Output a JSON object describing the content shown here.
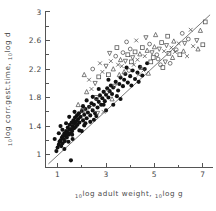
{
  "figure": {
    "background": "#ffffff",
    "ink": "#333333"
  },
  "chart_data": {
    "type": "scatter",
    "title": "",
    "subtitle": "",
    "xlabel": "10log adult weight, 10log g",
    "xlabel_parts": {
      "sub1": "10",
      "main1": "log adult weight,",
      "sub2": "10",
      "main2": "log g"
    },
    "ylabel": "10log corr.gest.time, 10log d",
    "ylabel_parts": {
      "sub1": "10",
      "main1": "log corr.gest.time,",
      "sub2": "10",
      "main2": "log d"
    },
    "xlim": [
      0.5,
      7.4
    ],
    "ylim": [
      0.82,
      3.02
    ],
    "xticks": [
      1,
      3,
      5,
      7
    ],
    "xticklabels": [
      "1",
      "3",
      "5",
      "7"
    ],
    "xminorticks": [
      2,
      4,
      6
    ],
    "yticks": [
      1,
      1.4,
      1.8,
      2.2,
      2.6,
      3
    ],
    "yticklabels": [
      "1",
      "1.4",
      "1.8",
      "2.2",
      "2.6",
      "3"
    ],
    "yminorticks": [
      1.2,
      1.6,
      2.0,
      2.4,
      2.8
    ],
    "grid": false,
    "legend": null,
    "legend_position": "none",
    "fit_line": {
      "label": "regression line",
      "x0": 0.62,
      "y0": 0.87,
      "x1": 7.3,
      "y1": 2.96,
      "slope": 0.313,
      "intercept": 0.676,
      "color": "#6b6b6b"
    },
    "marker_styles": {
      "filled": {
        "name": "filled-circle",
        "color": "#111111"
      },
      "open_circle": {
        "name": "open-circle",
        "color": "#4f4f4f"
      },
      "open_square": {
        "name": "open-square",
        "color": "#4f4f4f"
      },
      "open_triangle": {
        "name": "open-triangle-up",
        "color": "#4f4f4f"
      },
      "open_triangle_down": {
        "name": "open-triangle-down",
        "color": "#4f4f4f"
      },
      "cross": {
        "name": "cross-marker",
        "color": "#4f4f4f"
      }
    },
    "series": [
      {
        "name": "filled points",
        "marker": "filled",
        "points": [
          [
            0.95,
            1.05
          ],
          [
            1.0,
            1.1
          ],
          [
            1.05,
            1.14
          ],
          [
            1.08,
            1.18
          ],
          [
            1.12,
            1.2
          ],
          [
            1.15,
            1.12
          ],
          [
            1.18,
            1.24
          ],
          [
            1.2,
            1.16
          ],
          [
            1.22,
            1.26
          ],
          [
            1.25,
            1.22
          ],
          [
            1.28,
            1.3
          ],
          [
            1.3,
            1.19
          ],
          [
            1.32,
            1.27
          ],
          [
            1.35,
            1.33
          ],
          [
            1.38,
            1.24
          ],
          [
            1.4,
            1.31
          ],
          [
            1.42,
            1.38
          ],
          [
            1.45,
            1.28
          ],
          [
            1.48,
            1.35
          ],
          [
            1.5,
            1.42
          ],
          [
            1.52,
            1.3
          ],
          [
            1.55,
            1.36
          ],
          [
            1.58,
            1.45
          ],
          [
            1.6,
            1.33
          ],
          [
            1.62,
            1.4
          ],
          [
            1.65,
            1.48
          ],
          [
            1.68,
            1.37
          ],
          [
            1.7,
            1.44
          ],
          [
            1.72,
            1.52
          ],
          [
            1.75,
            1.39
          ],
          [
            1.78,
            1.47
          ],
          [
            1.8,
            1.55
          ],
          [
            1.82,
            1.42
          ],
          [
            1.85,
            1.5
          ],
          [
            1.88,
            1.58
          ],
          [
            1.9,
            1.45
          ],
          [
            1.95,
            1.53
          ],
          [
            2.0,
            1.61
          ],
          [
            2.05,
            1.48
          ],
          [
            2.1,
            1.56
          ],
          [
            2.15,
            1.64
          ],
          [
            2.2,
            1.51
          ],
          [
            2.25,
            1.59
          ],
          [
            2.3,
            1.67
          ],
          [
            2.35,
            1.55
          ],
          [
            2.4,
            1.72
          ],
          [
            2.45,
            1.62
          ],
          [
            2.5,
            1.7
          ],
          [
            2.55,
            1.58
          ],
          [
            2.6,
            1.78
          ],
          [
            2.65,
            1.66
          ],
          [
            2.7,
            1.74
          ],
          [
            2.75,
            1.83
          ],
          [
            2.8,
            1.7
          ],
          [
            2.85,
            1.79
          ],
          [
            2.9,
            1.88
          ],
          [
            2.95,
            1.75
          ],
          [
            3.0,
            1.84
          ],
          [
            3.05,
            1.93
          ],
          [
            3.1,
            1.8
          ],
          [
            3.15,
            1.89
          ],
          [
            3.2,
            1.97
          ],
          [
            3.25,
            1.85
          ],
          [
            3.3,
            1.94
          ],
          [
            3.4,
            2.02
          ],
          [
            3.5,
            1.9
          ],
          [
            3.55,
            1.99
          ],
          [
            3.6,
            2.08
          ],
          [
            3.7,
            1.96
          ],
          [
            3.75,
            2.05
          ],
          [
            3.8,
            2.13
          ],
          [
            3.9,
            2.01
          ],
          [
            4.0,
            2.1
          ],
          [
            4.1,
            2.18
          ],
          [
            4.2,
            2.06
          ],
          [
            4.3,
            2.15
          ],
          [
            4.4,
            2.23
          ],
          [
            4.5,
            2.11
          ],
          [
            4.6,
            2.2
          ],
          [
            4.7,
            2.28
          ],
          [
            1.28,
            1.08
          ],
          [
            1.45,
            1.18
          ],
          [
            1.62,
            1.22
          ],
          [
            1.9,
            1.34
          ],
          [
            2.1,
            1.41
          ],
          [
            2.35,
            1.46
          ],
          [
            0.88,
            1.22
          ],
          [
            1.05,
            1.3
          ],
          [
            1.55,
            0.92
          ],
          [
            2.0,
            1.33
          ],
          [
            2.5,
            1.49
          ],
          [
            3.0,
            1.62
          ],
          [
            3.3,
            1.7
          ],
          [
            3.6,
            1.78
          ],
          [
            1.35,
            1.44
          ],
          [
            1.7,
            1.6
          ],
          [
            2.2,
            1.76
          ],
          [
            2.7,
            1.92
          ],
          [
            3.1,
            2.05
          ],
          [
            1.12,
            1.4
          ],
          [
            1.48,
            1.53
          ],
          [
            1.2,
            1.35
          ],
          [
            1.6,
            1.28
          ],
          [
            2.05,
            1.68
          ],
          [
            2.45,
            1.81
          ],
          [
            2.9,
            1.7
          ],
          [
            3.45,
            1.82
          ],
          [
            3.85,
            2.22
          ],
          [
            4.05,
            1.97
          ],
          [
            4.35,
            2.02
          ],
          [
            2.6,
            1.54
          ],
          [
            2.15,
            1.44
          ]
        ]
      },
      {
        "name": "open points",
        "marker": "open_circle",
        "points": [
          [
            2.4,
            1.92
          ],
          [
            2.55,
            2.0
          ],
          [
            2.7,
            2.09
          ],
          [
            2.85,
            2.16
          ],
          [
            3.0,
            2.24
          ],
          [
            3.1,
            2.12
          ],
          [
            3.2,
            2.31
          ],
          [
            3.3,
            2.2
          ],
          [
            3.4,
            2.38
          ],
          [
            3.5,
            2.26
          ],
          [
            3.6,
            2.33
          ],
          [
            3.7,
            2.43
          ],
          [
            3.8,
            2.31
          ],
          [
            3.9,
            2.4
          ],
          [
            4.0,
            2.48
          ],
          [
            4.1,
            2.36
          ],
          [
            4.2,
            2.44
          ],
          [
            4.3,
            2.33
          ],
          [
            4.4,
            2.41
          ],
          [
            4.5,
            2.5
          ],
          [
            4.6,
            2.38
          ],
          [
            4.7,
            2.46
          ],
          [
            4.8,
            2.55
          ],
          [
            4.9,
            2.43
          ],
          [
            5.0,
            2.51
          ],
          [
            5.1,
            2.4
          ],
          [
            5.2,
            2.48
          ],
          [
            5.3,
            2.57
          ],
          [
            5.4,
            2.45
          ],
          [
            5.5,
            2.53
          ],
          [
            5.6,
            2.42
          ],
          [
            5.7,
            2.5
          ],
          [
            5.8,
            2.59
          ],
          [
            5.9,
            2.47
          ],
          [
            6.0,
            2.56
          ],
          [
            6.2,
            2.45
          ],
          [
            6.4,
            2.62
          ],
          [
            6.6,
            2.52
          ],
          [
            6.9,
            2.74
          ],
          [
            7.1,
            2.86
          ],
          [
            2.3,
            2.05
          ],
          [
            2.2,
            1.88
          ],
          [
            2.6,
            1.8
          ],
          [
            3.05,
            1.88
          ],
          [
            3.35,
            1.96
          ],
          [
            3.55,
            2.12
          ],
          [
            3.95,
            2.18
          ],
          [
            4.15,
            2.26
          ],
          [
            4.45,
            2.22
          ],
          [
            4.85,
            2.3
          ],
          [
            5.15,
            2.34
          ],
          [
            5.45,
            2.3
          ],
          [
            5.75,
            2.36
          ],
          [
            6.05,
            2.4
          ],
          [
            6.35,
            2.38
          ],
          [
            6.75,
            2.6
          ],
          [
            2.1,
            2.12
          ],
          [
            2.45,
            2.2
          ],
          [
            2.75,
            2.28
          ],
          [
            3.15,
            2.42
          ],
          [
            3.45,
            2.5
          ],
          [
            3.85,
            2.58
          ],
          [
            4.25,
            2.6
          ],
          [
            4.65,
            2.64
          ],
          [
            5.05,
            2.68
          ],
          [
            5.55,
            2.66
          ],
          [
            6.15,
            2.7
          ],
          [
            6.5,
            2.75
          ],
          [
            1.85,
            1.7
          ],
          [
            2.05,
            1.62
          ],
          [
            2.35,
            1.66
          ],
          [
            2.65,
            1.58
          ],
          [
            3.25,
            1.78
          ],
          [
            2.9,
            1.6
          ],
          [
            4.95,
            2.36
          ],
          [
            5.25,
            2.26
          ],
          [
            5.85,
            2.44
          ],
          [
            6.25,
            2.56
          ],
          [
            6.8,
            2.48
          ],
          [
            7.0,
            2.54
          ],
          [
            4.55,
            2.18
          ],
          [
            4.75,
            2.14
          ],
          [
            5.35,
            2.22
          ],
          [
            5.65,
            2.28
          ],
          [
            3.65,
            2.24
          ],
          [
            3.75,
            2.16
          ],
          [
            4.05,
            2.3
          ],
          [
            4.35,
            2.12
          ]
        ]
      }
    ]
  }
}
